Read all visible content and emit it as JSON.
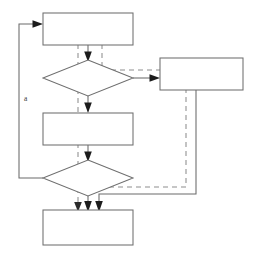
{
  "diagram": {
    "type": "flowchart",
    "title": "",
    "canvas": {
      "width": 258,
      "height": 254,
      "background": "#ffffff"
    },
    "style": {
      "shape_stroke": "#6f6f6f",
      "shape_fill": "#ffffff",
      "solid_edge_color": "#6a6a6a",
      "dashed_edge_color": "#8e8e8e",
      "arrowhead_color": "#1c1c1c",
      "label_color": "#3a3a3a"
    },
    "nodes": [
      {
        "id": "n1",
        "shape": "rectangle",
        "label": "",
        "x": 43,
        "y": 13,
        "w": 90,
        "h": 32
      },
      {
        "id": "n2",
        "shape": "diamond",
        "label": "",
        "x": 43,
        "y": 60,
        "w": 90,
        "h": 36
      },
      {
        "id": "n3",
        "shape": "rectangle",
        "label": "",
        "x": 43,
        "y": 113,
        "w": 90,
        "h": 32
      },
      {
        "id": "n4",
        "shape": "diamond",
        "label": "",
        "x": 43,
        "y": 160,
        "w": 90,
        "h": 36
      },
      {
        "id": "n5",
        "shape": "rectangle",
        "label": "",
        "x": 43,
        "y": 210,
        "w": 90,
        "h": 35
      },
      {
        "id": "n6",
        "shape": "rectangle",
        "label": "",
        "x": 160,
        "y": 58,
        "w": 83,
        "h": 32
      }
    ],
    "edges": [
      {
        "id": "e1",
        "from": "n1",
        "to": "n2",
        "style": "solid",
        "label": ""
      },
      {
        "id": "e2",
        "from": "n2",
        "to": "n3",
        "style": "solid",
        "label": ""
      },
      {
        "id": "e3",
        "from": "n3",
        "to": "n4",
        "style": "solid",
        "label": ""
      },
      {
        "id": "e4",
        "from": "n4",
        "to": "n5",
        "style": "solid",
        "label": ""
      },
      {
        "id": "e5",
        "from": "n2",
        "to": "n6",
        "style": "solid",
        "label": ""
      },
      {
        "id": "e6",
        "from": "n4",
        "to": "n1",
        "style": "solid",
        "label": "a"
      },
      {
        "id": "e7",
        "from": "n6",
        "to": "n5",
        "style": "solid",
        "label": ""
      },
      {
        "id": "e8",
        "from": "n1",
        "to": "n5",
        "style": "dashed",
        "label": ""
      },
      {
        "id": "e9",
        "from": "n1",
        "to": "n2",
        "style": "dashed",
        "label": ""
      },
      {
        "id": "e10",
        "from": "n2",
        "to": "n6",
        "style": "dashed",
        "label": ""
      },
      {
        "id": "e11",
        "from": "n6",
        "to": "n4",
        "style": "dashed",
        "label": ""
      }
    ],
    "labels": [
      {
        "id": "lbl-a",
        "text": "a",
        "x": 24,
        "y": 99
      }
    ]
  }
}
